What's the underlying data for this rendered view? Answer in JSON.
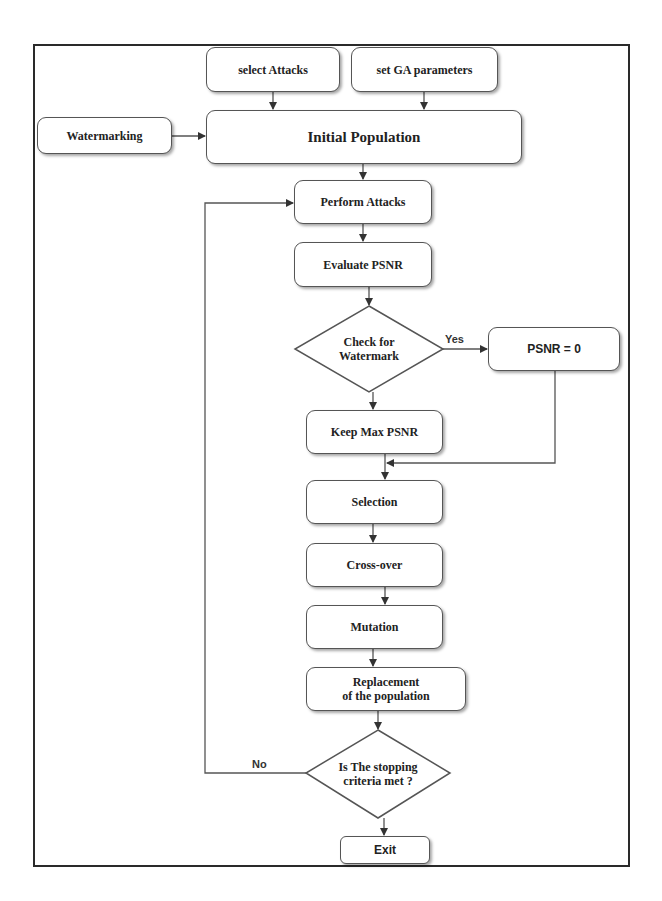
{
  "diagram": {
    "type": "flowchart",
    "nodes": {
      "select_attacks": "select Attacks",
      "set_ga": "set GA parameters",
      "watermarking": "Watermarking",
      "initial_population": "Initial Population",
      "perform_attacks": "Perform Attacks",
      "evaluate_psnr": "Evaluate PSNR",
      "check_watermark_l1": "Check for",
      "check_watermark_l2": "Watermark",
      "psnr_zero": "PSNR = 0",
      "keep_max": "Keep Max PSNR",
      "selection": "Selection",
      "crossover": "Cross-over",
      "mutation": "Mutation",
      "replacement_l1": "Replacement",
      "replacement_l2": "of the population",
      "stopping_l1": "Is The stopping",
      "stopping_l2": "criteria met ?",
      "exit": "Exit"
    },
    "edge_labels": {
      "yes": "Yes",
      "no": "No"
    },
    "edges": [
      [
        "select_attacks",
        "initial_population"
      ],
      [
        "set_ga",
        "initial_population"
      ],
      [
        "watermarking",
        "initial_population"
      ],
      [
        "initial_population",
        "perform_attacks"
      ],
      [
        "perform_attacks",
        "evaluate_psnr"
      ],
      [
        "evaluate_psnr",
        "check_watermark"
      ],
      [
        "check_watermark",
        "psnr_zero",
        "Yes"
      ],
      [
        "check_watermark",
        "keep_max"
      ],
      [
        "psnr_zero",
        "selection"
      ],
      [
        "keep_max",
        "selection"
      ],
      [
        "selection",
        "crossover"
      ],
      [
        "crossover",
        "mutation"
      ],
      [
        "mutation",
        "replacement"
      ],
      [
        "replacement",
        "stopping"
      ],
      [
        "stopping",
        "perform_attacks",
        "No"
      ],
      [
        "stopping",
        "exit"
      ]
    ]
  }
}
